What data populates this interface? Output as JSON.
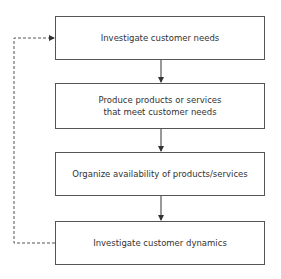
{
  "diagram": {
    "steps": [
      {
        "label": "Investigate customer needs"
      },
      {
        "label": "Produce products or services that meet customer needs"
      },
      {
        "label": "Organize availability of products/services"
      },
      {
        "label": "Investigate customer dynamics"
      }
    ],
    "feedback_loop": {
      "from": "Investigate customer dynamics",
      "to": "Investigate customer needs",
      "style": "dashed"
    }
  }
}
